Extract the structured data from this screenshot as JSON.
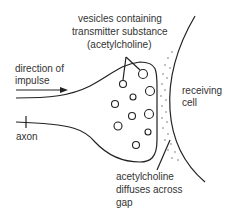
{
  "diagram": {
    "labels": {
      "vesicles": [
        "vesicles containing",
        "transmitter substance",
        "(acetylcholine)"
      ],
      "direction": [
        "direction of",
        "impulse"
      ],
      "receiving": [
        "receiving",
        "cell"
      ],
      "axon": "axon",
      "diffuses": [
        "acetylcholine",
        "diffuses across",
        "gap"
      ]
    },
    "colors": {
      "line": "#222222",
      "text": "#333333",
      "background": "#ffffff"
    }
  }
}
